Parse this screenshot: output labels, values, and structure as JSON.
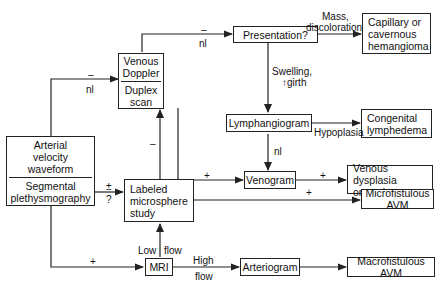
{
  "nodes": {
    "arterial": {
      "top": "Arterial velocity waveform",
      "top_lines": [
        "Arterial",
        "velocity",
        "waveform"
      ],
      "bottom_lines": [
        "Segmental",
        "plethysmography"
      ]
    },
    "venous_doppler": {
      "top_lines": [
        "Venous",
        "Doppler"
      ],
      "bottom_lines": [
        "Duplex",
        "scan"
      ]
    },
    "presentation": {
      "label": "Presentation?"
    },
    "capillary": {
      "lines": [
        "Capillary or",
        "cavernous",
        "hemangioma"
      ]
    },
    "lymphangiogram": {
      "label": "Lymphangiogram"
    },
    "congenital": {
      "lines": [
        "Congenital",
        "lymphedema"
      ]
    },
    "venogram": {
      "label": "Venogram"
    },
    "venous_dysplasia": {
      "lines": [
        "Venous dysplasia",
        "or angioma"
      ]
    },
    "microsphere": {
      "lines": [
        "Labeled",
        "microsphere",
        "study"
      ]
    },
    "micro_avm": {
      "label": "Microfistulous AVM"
    },
    "mri": {
      "label": "MRI"
    },
    "arteriogram": {
      "label": "Arteriogram"
    },
    "macro_avm": {
      "label": "Macrofistulous AVM"
    }
  },
  "edge_labels": {
    "arterial_to_venous_top": "–",
    "arterial_to_venous_bottom": "nl",
    "venous_to_presentation_top": "–",
    "venous_to_presentation_bottom": "nl",
    "presentation_to_capillary_1": "Mass,",
    "presentation_to_capillary_2": "discoloration",
    "presentation_to_lymph_1": "Swelling,",
    "presentation_to_lymph_2": "↑girth",
    "lymph_to_congenital": "Hypoplasia",
    "lymph_to_venogram": "nl",
    "venous_to_venogram": "+",
    "venogram_to_dysplasia": "+",
    "microsphere_to_venous": "–",
    "arterial_to_microsphere_top": "±",
    "arterial_to_microsphere_bottom": "?",
    "microsphere_to_micro_avm": "+",
    "arterial_to_mri": "+",
    "mri_low_flow_1": "Low",
    "mri_low_flow_2": "flow",
    "mri_high_flow_1": "High",
    "mri_high_flow_2": "flow"
  }
}
